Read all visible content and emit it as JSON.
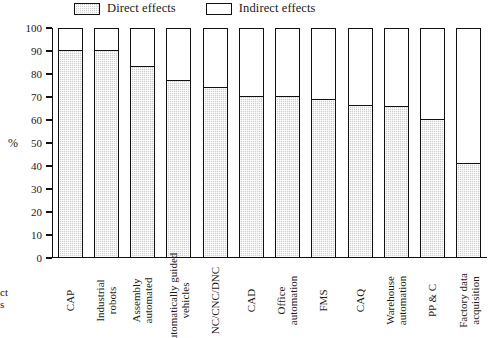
{
  "chart_data": {
    "type": "bar",
    "subtype": "stacked-100-percent",
    "title": "",
    "xlabel": "",
    "ylabel": "%",
    "ylim": [
      0,
      100
    ],
    "ytick_step": 10,
    "yticks": [
      100,
      90,
      80,
      70,
      60,
      50,
      40,
      30,
      20,
      10,
      0
    ],
    "grid": false,
    "legend_position": "top",
    "categories": [
      "CAP",
      "Industrial robots",
      "Assembly automated",
      "Automatically guided vehicles",
      "NC/CNC/DNC",
      "CAD",
      "Office automation",
      "FMS",
      "CAQ",
      "Warehouse automation",
      "PP & C",
      "Factory data acquisition"
    ],
    "series": [
      {
        "name": "Direct effects",
        "color": "#cdcdcd",
        "values": [
          90,
          90,
          83,
          77,
          74,
          70,
          70,
          68.5,
          66,
          65.5,
          60,
          41
        ]
      },
      {
        "name": "Indirect effects",
        "color": "#ffffff",
        "values": [
          10,
          10,
          17,
          23,
          26,
          30,
          30,
          31.5,
          34,
          34.5,
          40,
          59
        ]
      }
    ]
  },
  "legend": {
    "items": [
      {
        "label": "Direct effects",
        "swatch": "direct"
      },
      {
        "label": "Indirect effects",
        "swatch": "indirect"
      }
    ]
  },
  "axis": {
    "y_title": "%"
  },
  "edge_text": {
    "fragment_line1": "ct",
    "fragment_line2": "s"
  }
}
